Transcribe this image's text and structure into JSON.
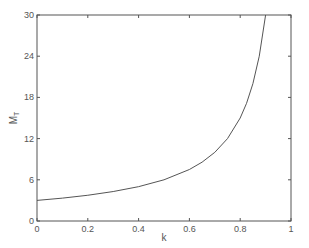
{
  "chart_data": {
    "type": "line",
    "title": "",
    "xlabel": "k",
    "ylabel": "M",
    "ylabel_subscript": "T",
    "xlim": [
      0,
      1
    ],
    "ylim": [
      0,
      30
    ],
    "xticks": [
      0,
      0.2,
      0.4,
      0.6,
      0.8,
      1
    ],
    "xtick_labels": [
      "0",
      "0.2",
      "0.4",
      "0.6",
      "0.8",
      "1"
    ],
    "yticks": [
      0,
      6,
      12,
      18,
      24,
      30
    ],
    "ytick_labels": [
      "0",
      "6",
      "12",
      "18",
      "24",
      "30"
    ],
    "grid": false,
    "legend": null,
    "box": true,
    "series": [
      {
        "name": "M_T",
        "x": [
          0,
          0.1,
          0.2,
          0.3,
          0.4,
          0.5,
          0.6,
          0.65,
          0.7,
          0.75,
          0.8,
          0.825,
          0.85,
          0.875,
          0.9
        ],
        "y": [
          3.0,
          3.33,
          3.75,
          4.29,
          5.0,
          6.0,
          7.5,
          8.57,
          10.0,
          12.0,
          15.0,
          17.14,
          20.0,
          24.0,
          30.0
        ]
      }
    ]
  },
  "colors": {
    "axes": "#555555",
    "line": "#555555",
    "text": "#555555",
    "background": "#ffffff"
  }
}
